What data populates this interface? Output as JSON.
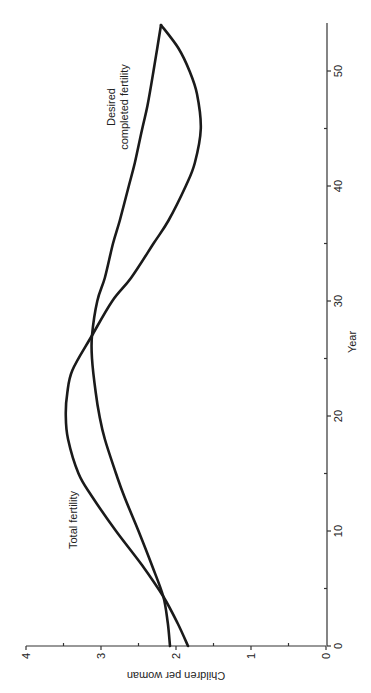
{
  "chart_data": {
    "type": "line",
    "title": "",
    "orientation": "rotated 90° (year runs bottom-to-top on right edge; value axis runs right-to-left along bottom)",
    "xlabel": "Year",
    "ylabel": "Children per woman",
    "xlim": [
      0,
      54
    ],
    "ylim": [
      0,
      4
    ],
    "x_ticks": [
      0,
      10,
      20,
      30,
      40,
      50
    ],
    "x_minor_ticks": [
      5,
      15,
      25,
      35,
      45
    ],
    "y_ticks": [
      0,
      1,
      2,
      3,
      4
    ],
    "y_minor_ticks": [
      0.5,
      1.5,
      2.5,
      3.5
    ],
    "grid": false,
    "legend": "none (inline annotations)",
    "series": [
      {
        "name": "Total fertility",
        "x": [
          0,
          2,
          4.3,
          7,
          10,
          13,
          15,
          18,
          20,
          22,
          24,
          27,
          30,
          32,
          35,
          37,
          40,
          42,
          45,
          48,
          50,
          52,
          54
        ],
        "values": [
          1.84,
          1.98,
          2.17,
          2.45,
          2.8,
          3.12,
          3.3,
          3.44,
          3.47,
          3.45,
          3.38,
          3.12,
          2.85,
          2.6,
          2.3,
          2.1,
          1.87,
          1.75,
          1.67,
          1.72,
          1.82,
          1.97,
          2.2
        ]
      },
      {
        "name": "Desired completed fertility",
        "x": [
          0,
          2,
          4.3,
          7,
          10,
          13,
          15,
          18,
          20,
          22,
          25,
          27,
          30,
          32,
          35,
          37,
          40,
          42,
          45,
          47,
          50,
          52,
          54
        ],
        "values": [
          2.08,
          2.11,
          2.17,
          2.32,
          2.5,
          2.69,
          2.8,
          2.95,
          3.02,
          3.07,
          3.12,
          3.12,
          3.05,
          2.95,
          2.84,
          2.75,
          2.63,
          2.55,
          2.45,
          2.38,
          2.3,
          2.25,
          2.2
        ]
      }
    ],
    "annotations": [
      {
        "text": "Total fertility",
        "near_year": 12,
        "near_value": 3.4
      },
      {
        "text": "Desired completed fertility",
        "lines": [
          "Desired",
          "completed fertility"
        ],
        "near_year": 44,
        "near_value": 2.7
      }
    ]
  },
  "labels": {
    "x_axis_title": "Year",
    "y_axis_title": "Children per woman",
    "x_tick_labels": [
      "0",
      "10",
      "20",
      "30",
      "40",
      "50"
    ],
    "y_tick_labels": [
      "0",
      "1",
      "2",
      "3",
      "4"
    ],
    "annotation_total": "Total fertility",
    "annotation_desired_line1": "Desired",
    "annotation_desired_line2": "completed fertility"
  },
  "colors": {
    "background": "#ffffff",
    "line": "#1a1a1a",
    "axis": "#333333"
  }
}
